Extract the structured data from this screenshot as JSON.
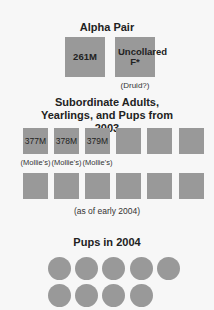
{
  "alpha_pair": {
    "title": "Alpha Pair",
    "members": [
      {
        "label": "261M",
        "note": ""
      },
      {
        "label": "Uncollared F*",
        "note": "(Druid?)"
      }
    ]
  },
  "subordinates": {
    "title": "Subordinate Adults, Yearlings, and Pups from 2003",
    "row1": [
      {
        "label": "377M",
        "note": "(Mollie's)"
      },
      {
        "label": "378M",
        "note": "(Mollie's)"
      },
      {
        "label": "379M",
        "note": "(Mollie's)"
      },
      {
        "label": "",
        "note": ""
      },
      {
        "label": "",
        "note": ""
      },
      {
        "label": "",
        "note": ""
      }
    ],
    "row2_count": 6,
    "footnote": "(as of early 2004)"
  },
  "pups": {
    "title": "Pups in 2004",
    "count": 9
  },
  "colors": {
    "square": "#999999",
    "background": "#f7f7f7"
  }
}
